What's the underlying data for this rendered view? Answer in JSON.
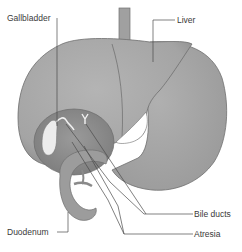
{
  "labels": {
    "gallbladder": "Gallbladder",
    "liver": "Liver",
    "duodenum": "Duodenum",
    "bile_ducts": "Bile ducts",
    "atresia": "Atresia"
  },
  "colors": {
    "organ_fill": "#a9a9a9",
    "organ_dark": "#8c8c8c",
    "outline": "#6e6e6e",
    "gallbladder_fill": "#ececec",
    "leader_line": "#4a4a4a",
    "text": "#3a3a3a",
    "background": "#ffffff"
  }
}
